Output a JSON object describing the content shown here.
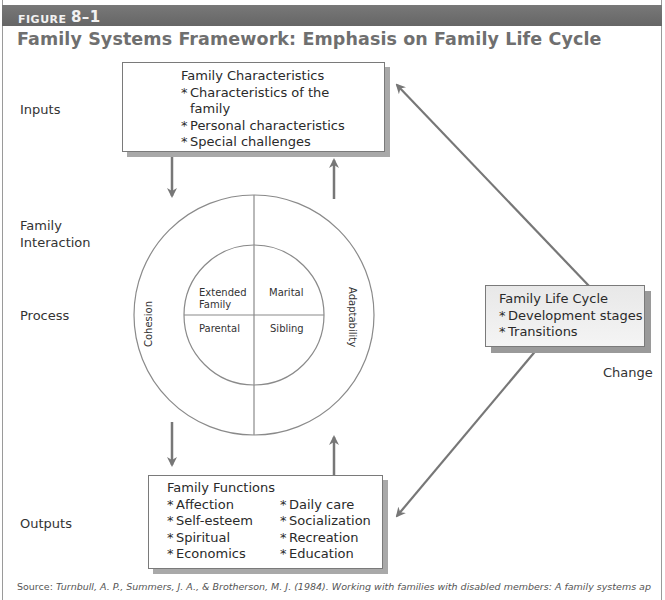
{
  "figure": {
    "label_prefix": "FIGURE",
    "label_number": "8–1",
    "title": "Family Systems Framework: Emphasis on Family Life Cycle"
  },
  "row_labels": {
    "inputs": "Inputs",
    "interaction_line1": "Family",
    "interaction_line2": "Interaction",
    "process": "Process",
    "outputs": "Outputs",
    "change": "Change"
  },
  "inputs_box": {
    "heading": "Family Characteristics",
    "items": [
      {
        "line1": "Characteristics of the",
        "line2": "family"
      },
      {
        "line1": "Personal characteristics"
      },
      {
        "line1": "Special challenges"
      }
    ]
  },
  "interaction_circle": {
    "outer_left": "Cohesion",
    "outer_right": "Adaptability",
    "quadrants": {
      "top_left_line1": "Extended",
      "top_left_line2": "Family",
      "top_right": "Marital",
      "bottom_left": "Parental",
      "bottom_right": "Sibling"
    }
  },
  "life_cycle_box": {
    "heading": "Family Life Cycle",
    "items": [
      "Development stages",
      "Transitions"
    ]
  },
  "outputs_box": {
    "heading": "Family Functions",
    "col1": [
      "Affection",
      "Self-esteem",
      "Spiritual",
      "Economics"
    ],
    "col2": [
      "Daily care",
      "Socialization",
      "Recreation",
      "Education"
    ]
  },
  "bullet": "*",
  "footer": {
    "source_label": "Source:",
    "citation": "Turnbull, A. P., Summers, J. A., & Brotherson, M. J. (1984). Working with families with disabled members: A family systems ap"
  },
  "colors": {
    "header_bar": "#6e6e6e",
    "title": "#6f6f6f",
    "arrow": "#777777",
    "line": "#8a8a8a",
    "shadow": "#a9a9a9"
  }
}
